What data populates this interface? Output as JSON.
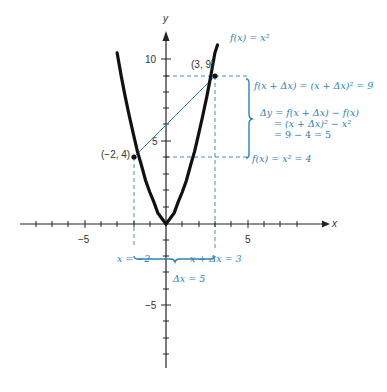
{
  "diagram": {
    "axes": {
      "x_label": "x",
      "y_label": "y",
      "x_ticks": {
        "neg5": "−5",
        "pos5": "5"
      },
      "y_ticks": {
        "pos10": "10",
        "pos5": "5",
        "neg5": "−5"
      }
    },
    "points": {
      "p1": "(−2, 4)",
      "p2": "(3, 9)"
    },
    "annotations": {
      "function": "f(x) = x²",
      "f_x_plus_dx": "f(x + Δx) = (x + Δx)² = 9",
      "dy_line1": "Δy = f(x + Δx) − f(x)",
      "dy_line2": "= (x + Δx)² − x²",
      "dy_line3": "= 9 − 4 = 5",
      "f_x": "f(x) = x² = 4",
      "x_eq": "x = −2",
      "x_plus_dx": "x + Δx = 3",
      "dx": "Δx = 5"
    },
    "colors": {
      "curve": "#111111",
      "axis": "#222222",
      "annotation": "#2f82b4"
    }
  }
}
